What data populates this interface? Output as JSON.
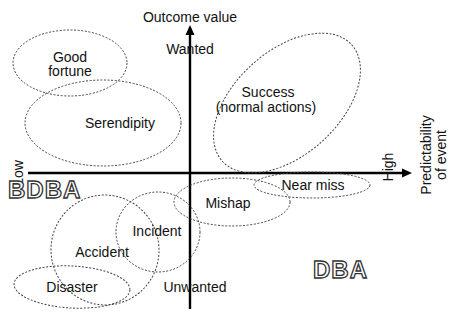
{
  "diagram": {
    "type": "quadrant-ellipse-diagram",
    "y_axis": {
      "title": "Outcome value",
      "top_label": "Wanted",
      "bottom_label": "Unwanted"
    },
    "x_axis": {
      "title_line1": "Predictability",
      "title_line2": "of event",
      "left_label": "Low",
      "right_label": "High"
    },
    "regions": {
      "left": "BDBA",
      "right": "DBA"
    },
    "ellipses": [
      {
        "id": "good-fortune",
        "line1": "Good",
        "line2": "fortune"
      },
      {
        "id": "serendipity",
        "line1": "Serendipity"
      },
      {
        "id": "success",
        "line1": "Success",
        "line2": "(normal actions)"
      },
      {
        "id": "near-miss",
        "line1": "Near miss"
      },
      {
        "id": "mishap",
        "line1": "Mishap"
      },
      {
        "id": "incident",
        "line1": "Incident"
      },
      {
        "id": "accident",
        "line1": "Accident"
      },
      {
        "id": "disaster",
        "line1": "Disaster"
      }
    ]
  }
}
